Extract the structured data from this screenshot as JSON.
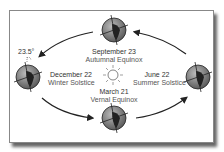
{
  "diagram": {
    "tilt_label": "23.5°",
    "positions": [
      {
        "id": "september",
        "date": "September 23",
        "event": "Autumnal Equinox"
      },
      {
        "id": "december",
        "date": "December 22",
        "event": "Winter Solstice"
      },
      {
        "id": "june",
        "date": "June 22",
        "event": "Summer Solstice"
      },
      {
        "id": "march",
        "date": "March 21",
        "event": "Vernal Equinox"
      }
    ],
    "center": "sun",
    "colors": {
      "earth": "#777777",
      "land": "#222222",
      "frame": "#888888"
    }
  }
}
